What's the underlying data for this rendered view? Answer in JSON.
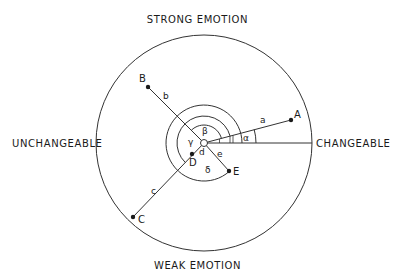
{
  "axes": {
    "top": "STRONG EMOTION",
    "bottom": "WEAK EMOTION",
    "left": "UNCHANGEABLE",
    "right": "CHANGEABLE"
  },
  "points": [
    {
      "label": "A",
      "segment": "a"
    },
    {
      "label": "B",
      "segment": "b"
    },
    {
      "label": "C",
      "segment": "c"
    },
    {
      "label": "D",
      "segment": "d"
    },
    {
      "label": "E",
      "segment": "e"
    }
  ],
  "angles": {
    "alpha": "α",
    "beta": "β",
    "gamma": "γ",
    "delta": "δ"
  },
  "colors": {
    "ink": "#1a1a1a",
    "background": "#ffffff"
  }
}
